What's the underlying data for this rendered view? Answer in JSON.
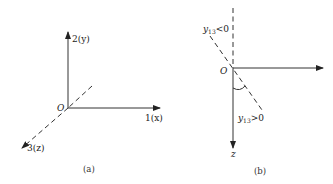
{
  "panel_a": {
    "caption": "(a)",
    "origin_label": "O",
    "axis_y_label": "2(y)",
    "axis_x_label": "1(x)",
    "axis_z_label": "3(z)"
  },
  "panel_b": {
    "caption": "(b)",
    "origin_label": "O",
    "axis_z_label": "z",
    "upper_label": "y13<0",
    "upper_label_parts": {
      "sym": "y",
      "sub": "13",
      "rel": "<0"
    },
    "lower_label": "y13>0",
    "lower_label_parts": {
      "sym": "y",
      "sub": "13",
      "rel": ">0"
    }
  }
}
